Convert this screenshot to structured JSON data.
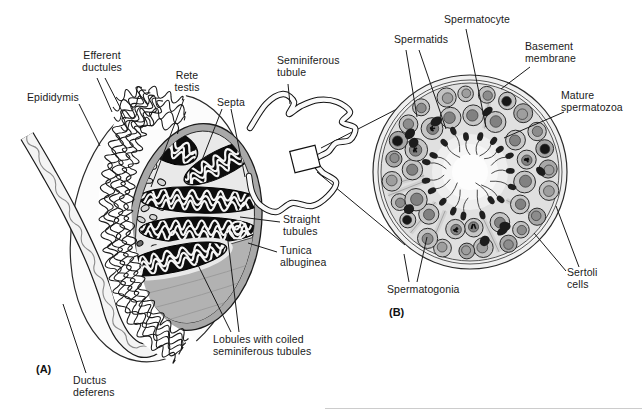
{
  "panel_a": {
    "panel_label": "(A)",
    "labels": {
      "efferent_ductules": "Efferent\nductules",
      "epididymis": "Epididymis",
      "rete_testis": "Rete\ntestis",
      "septa": "Septa",
      "seminiferous_tubule": "Seminiferous\ntubule",
      "straight_tubules": "Straight\ntubules",
      "tunica_albuginea": "Tunica\nalbuginea",
      "lobules": "Lobules with coiled\nseminiferous tubules",
      "ductus_deferens": "Ductus\ndeferens"
    }
  },
  "panel_b": {
    "panel_label": "(B)",
    "labels": {
      "spermatids": "Spermatids",
      "spermatocyte": "Spermatocyte",
      "basement_membrane": "Basement\nmembrane",
      "mature_spermatozoa": "Mature\nspermatozoa",
      "sertoli_cells": "Sertoli\ncells",
      "spermatogonia": "Spermatogonia"
    }
  },
  "colors": {
    "ink": "#1a1a1a",
    "paper": "#ffffff",
    "tissue_light": "#e9e9e9",
    "tissue_mid": "#b2b2b2",
    "tunica_ring": "#a8a8a8",
    "lobule_dark": "#0d0d0d",
    "cell_gray": "#c2c2c2",
    "nucleus_gray": "#8c8c8c",
    "spermatid_dark": "#1f1f1f"
  }
}
